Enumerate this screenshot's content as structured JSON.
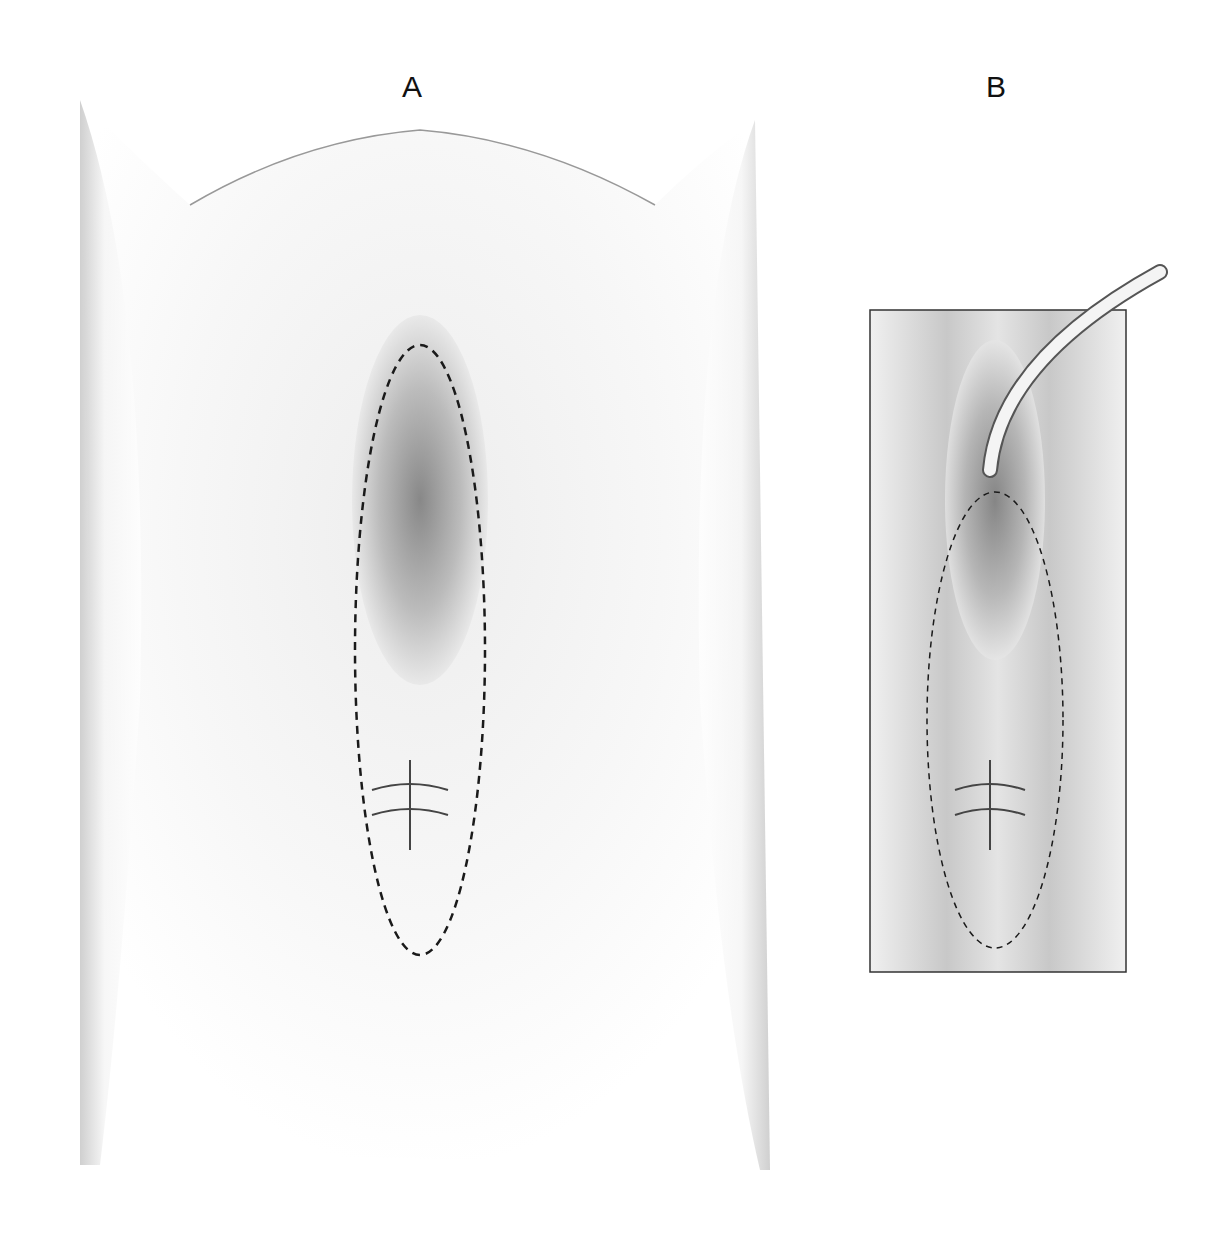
{
  "figure": {
    "panels": [
      {
        "id": "A",
        "label": "A",
        "description": "Surgical site overview with dashed outline marking incision region and two sutured areas"
      },
      {
        "id": "B",
        "label": "B",
        "description": "Framed inset view with catheter in place and dashed outline marking incision region"
      }
    ],
    "colors": {
      "outline": "#1a1a1a",
      "shade_dark": "#555555",
      "shade_light": "#f2f2f2"
    }
  }
}
